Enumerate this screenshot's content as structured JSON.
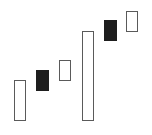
{
  "chart_data": {
    "type": "candlestick",
    "title": "",
    "xlabel": "",
    "ylabel": "",
    "grid": false,
    "legend": null,
    "axes_visible": false,
    "note": "No axes shown; values are relative heights measured in pixels from the bottom of the image (135 - y).",
    "ylim": [
      0,
      135
    ],
    "candles": [
      {
        "index": 1,
        "type": "bullish",
        "open": 14,
        "close": 55,
        "color": "#ffffff",
        "outline": "#5a5a5a"
      },
      {
        "index": 2,
        "type": "bearish",
        "open": 65,
        "close": 44,
        "color": "#1e1e1e",
        "outline": "#1e1e1e"
      },
      {
        "index": 3,
        "type": "bullish",
        "open": 54,
        "close": 75,
        "color": "#ffffff",
        "outline": "#5a5a5a"
      },
      {
        "index": 4,
        "type": "bullish",
        "open": 14,
        "close": 104,
        "color": "#ffffff",
        "outline": "#5a5a5a"
      },
      {
        "index": 5,
        "type": "bearish",
        "open": 115,
        "close": 94,
        "color": "#1e1e1e",
        "outline": "#1e1e1e"
      },
      {
        "index": 6,
        "type": "bullish",
        "open": 103,
        "close": 124,
        "color": "#ffffff",
        "outline": "#5a5a5a"
      }
    ],
    "layout": {
      "width": 152,
      "height": 135,
      "body_width": 12,
      "x_positions": [
        14,
        36,
        59,
        82,
        104,
        126
      ]
    }
  }
}
